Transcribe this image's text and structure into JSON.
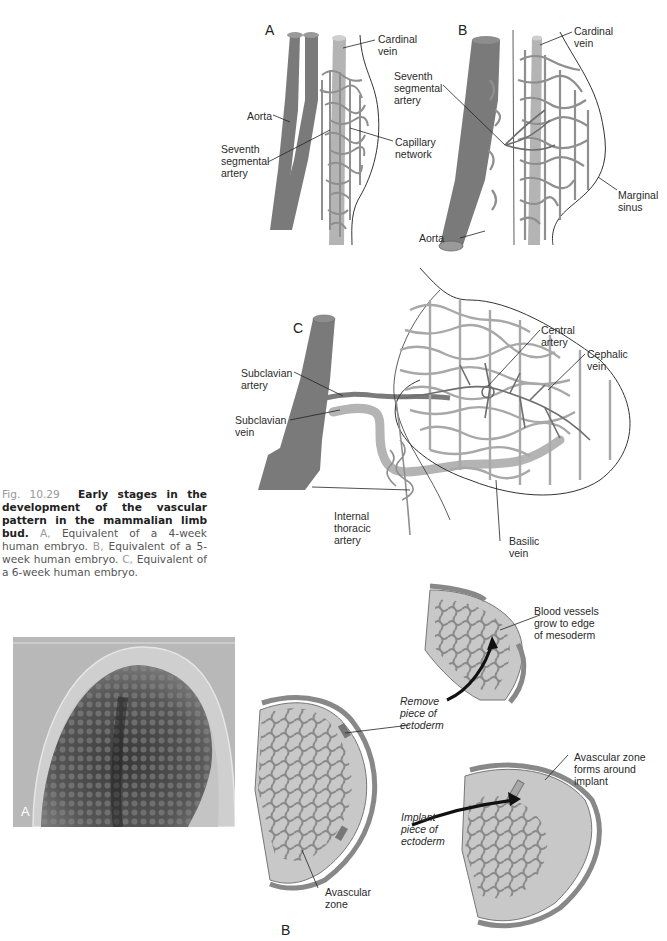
{
  "figure": {
    "number": "Fig. 10.29",
    "title": "Early stages in the development of the vascular pattern in the mammalian limb bud.",
    "items": [
      {
        "key": "A,",
        "text": "Equivalent of a 4-week human embryo."
      },
      {
        "key": "B,",
        "text": "Equivalent of a 5-week human embryo."
      },
      {
        "key": "C,",
        "text": "Equivalent of a 6-week human embryo."
      }
    ]
  },
  "panel_A": {
    "letter": "A",
    "labels": {
      "cardinal_vein": "Cardinal\nvein",
      "aorta": "Aorta",
      "seventh_segmental_artery": "Seventh\nsegmental\nartery",
      "capillary_network": "Capillary\nnetwork"
    }
  },
  "panel_B": {
    "letter": "B",
    "labels": {
      "cardinal_vein": "Cardinal\nvein",
      "seventh_segmental_artery": "Seventh\nsegmental\nartery",
      "marginal_sinus": "Marginal\nsinus",
      "aorta": "Aorta"
    }
  },
  "panel_C": {
    "letter": "C",
    "labels": {
      "subclavian_artery": "Subclavian\nartery",
      "subclavian_vein": "Subclavian\nvein",
      "central_artery": "Central\nartery",
      "cephalic_vein": "Cephalic\nvein",
      "internal_thoracic_artery": "Internal\nthoracic\nartery",
      "basilic_vein": "Basilic\nvein"
    }
  },
  "bottom_figure": {
    "photo_letter": "A",
    "diagram_letter": "B",
    "labels": {
      "blood_vessels": "Blood vessels\ngrow to edge\nof mesoderm",
      "remove_piece": "Remove\npiece of\nectoderm",
      "implant_piece": "Implant\npiece of\nectoderm",
      "avascular_zone": "Avascular\nzone",
      "avascular_zone_forms": "Avascular zone\nforms around\nimplant"
    }
  },
  "colors": {
    "artery": "#7a7a7a",
    "vein": "#b4b4b4",
    "capillary": "#8f8f8f",
    "mesoderm_fill": "#c8c8c8",
    "caption_bold": "#222222",
    "caption_gray": "#999999"
  }
}
